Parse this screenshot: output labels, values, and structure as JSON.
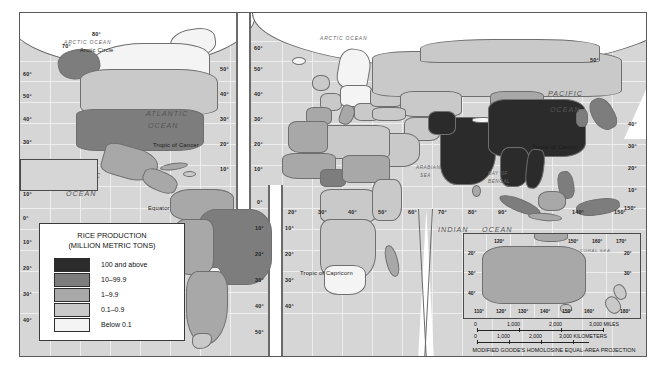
{
  "map": {
    "title": "Rice Production World Map",
    "background_color": "#d6d6d6",
    "border_color": "#5a5a5a"
  },
  "legend": {
    "title_line1": "RICE PRODUCTION",
    "title_line2": "(MILLION METRIC TONS)",
    "classes": [
      {
        "label": "100 and above",
        "color": "#2b2b2b"
      },
      {
        "label": "10–99.9",
        "color": "#7d7d7d"
      },
      {
        "label": "1–9.9",
        "color": "#a8a8a8"
      },
      {
        "label": "0.1–0.9",
        "color": "#c9c9c9"
      },
      {
        "label": "Below 0.1",
        "color": "#f4f4f4"
      }
    ]
  },
  "ocean_labels": [
    {
      "name": "arctic-ocean-left",
      "text": "ARCTIC OCEAN"
    },
    {
      "name": "arctic-ocean-right",
      "text": "ARCTIC OCEAN"
    },
    {
      "name": "atlantic-ocean",
      "text_line1": "ATLANTIC",
      "text_line2": "OCEAN"
    },
    {
      "name": "pacific-ocean-left",
      "text_line1": "PACIFIC",
      "text_line2": "OCEAN"
    },
    {
      "name": "pacific-ocean-right",
      "text_line1": "PACIFIC",
      "text_line2": "OCEAN"
    },
    {
      "name": "indian-ocean",
      "text_line1": "INDIAN",
      "text_line2": "OCEAN"
    }
  ],
  "sea_labels": [
    {
      "name": "arabian-sea",
      "line1": "ARABIAN",
      "line2": "SEA"
    },
    {
      "name": "bay-of-bengal",
      "line1": "BAY OF",
      "line2": "BENGAL"
    },
    {
      "name": "coral-sea",
      "text": "CORAL SEA"
    }
  ],
  "reference_lines": [
    {
      "name": "arctic-circle",
      "text": "Arctic Circle"
    },
    {
      "name": "tropic-of-cancer-atlantic",
      "text": "Tropic of Cancer"
    },
    {
      "name": "tropic-of-cancer-pacific",
      "text": "Tropic of Cancer"
    },
    {
      "name": "equator",
      "text": "Equator"
    },
    {
      "name": "tropic-of-capricorn",
      "text": "Tropic of Capricorn"
    }
  ],
  "graticule_labels": {
    "left_column": [
      "60°",
      "50°",
      "40°",
      "30°",
      "160°",
      "10°",
      "0°",
      "10°",
      "20°",
      "30°",
      "40°"
    ],
    "top_polar": [
      "80°",
      "70°"
    ],
    "atlantic_column": [
      "50°",
      "40°",
      "30°",
      "20°",
      "10°"
    ],
    "center_left_column": [
      "60°",
      "50°",
      "40°",
      "30°",
      "20°",
      "10°"
    ],
    "center_right_column": [
      "60°",
      "50°",
      "40°",
      "30°",
      "20°",
      "10°"
    ],
    "south_center_left": [
      "0°",
      "10°",
      "20°",
      "30°",
      "40°",
      "50°"
    ],
    "south_center_right": [
      "0°",
      "10°",
      "20°",
      "30°",
      "40°"
    ],
    "right_column": [
      "40°",
      "30°",
      "20°",
      "10°",
      "150°"
    ],
    "far_right_column": [
      "50°",
      "40°",
      "30°",
      "20°",
      "10°"
    ],
    "equator_row": [
      "20°",
      "30°",
      "40°",
      "50°",
      "60°",
      "70°",
      "80°",
      "90°",
      "140°",
      "150°"
    ],
    "left_top": [
      "80°",
      "70°",
      "60°"
    ]
  },
  "inset": {
    "name": "australia-new-zealand-inset",
    "top_ticks": [
      "120°",
      "150°",
      "160°",
      "170°"
    ],
    "bottom_ticks": [
      "110°",
      "120°",
      "130°",
      "140°",
      "150°",
      "160°",
      "180°"
    ],
    "left_ticks": [
      "20°",
      "30°",
      "40°"
    ],
    "right_ticks": [
      "20°",
      "30°"
    ]
  },
  "scale": {
    "miles_ticks": [
      "0",
      "1,000",
      "2,000",
      "3,000 MILES"
    ],
    "km_ticks": [
      "0",
      "1,000",
      "2,000",
      "3,000 KILOMETERS"
    ],
    "projection": "MODIFIED GOODE'S HOMOLOSINE EQUAL-AREA PROJECTION"
  }
}
